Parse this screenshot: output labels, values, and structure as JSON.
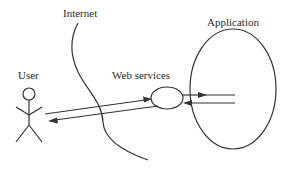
{
  "diagram": {
    "type": "architecture-sketch",
    "labels": {
      "internet": "Internet",
      "application": "Application",
      "user": "User",
      "web_services": "Web services"
    },
    "nodes": [
      {
        "id": "user",
        "label": "User",
        "shape": "stick-figure"
      },
      {
        "id": "web_services",
        "label": "Web services",
        "shape": "ellipse"
      },
      {
        "id": "application",
        "label": "Application",
        "shape": "large-ellipse"
      },
      {
        "id": "internet",
        "label": "Internet",
        "shape": "curved-boundary-line"
      }
    ],
    "edges": [
      {
        "from": "user",
        "to": "web_services",
        "direction": "forward"
      },
      {
        "from": "web_services",
        "to": "user",
        "direction": "forward"
      },
      {
        "from": "web_services",
        "to": "application",
        "direction": "forward"
      },
      {
        "from": "application",
        "to": "web_services",
        "direction": "forward"
      }
    ],
    "colors": {
      "stroke": "#333333",
      "text": "#2a2a2a",
      "background": "#ffffff"
    }
  }
}
